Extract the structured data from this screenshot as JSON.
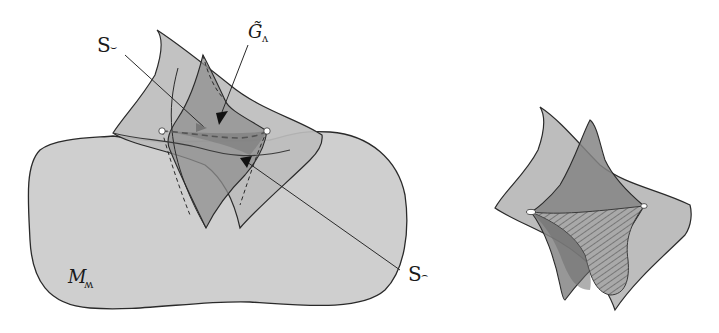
{
  "figure": {
    "colors": {
      "background": "#ffffff",
      "manifold_fill": "#cfcfcf",
      "surface_light": "#bdbdbd",
      "surface_mid": "#9e9e9e",
      "surface_dark": "#858585",
      "stroke": "#2a2a2a",
      "dot": "#ffffff"
    },
    "left": {
      "labels": {
        "manifold": "M",
        "manifold_sub": "ʍ",
        "surface_top": "S",
        "surface_top_sub": "⌣",
        "surface_bottom": "S",
        "surface_bottom_sub": "⌢",
        "geodesic": "G̃",
        "geodesic_sub": "ʌ"
      }
    },
    "right": {
      "description": "Two intersecting sheets with hatched region between two marked points"
    }
  }
}
